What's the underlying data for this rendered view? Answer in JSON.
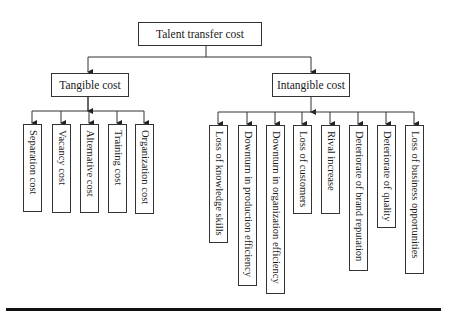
{
  "diagram": {
    "root": {
      "label": "Talent transfer cost"
    },
    "branches": [
      {
        "label": "Tangible cost",
        "children": [
          "Separation cost",
          "Vacancy cost",
          "Alternative cost",
          "Training cost",
          "Organization cost"
        ]
      },
      {
        "label": "Intangible cost",
        "children": [
          "Loss of knowledge skills",
          "Downturn in production efficiency",
          "Downturn in organization efficiency",
          "Loss of customers",
          "Rival increase",
          "Deteriorate of brand reputation",
          "Deteriorate of quality",
          "Loss of business opportunities"
        ]
      }
    ]
  }
}
